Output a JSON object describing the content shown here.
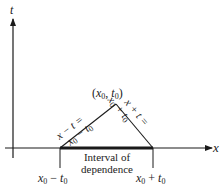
{
  "figure": {
    "axes": {
      "x_label": "x",
      "t_label": "t"
    },
    "apex": {
      "label_open": "(",
      "x_var": "x",
      "x_sub": "0",
      "sep": ", ",
      "t_var": "t",
      "t_sub": "0",
      "label_close": ")"
    },
    "left_characteristic": {
      "line1": "x − t =",
      "line2_var": "x",
      "line2_sub": "0",
      "line2_rest": " − t",
      "line2_sub2": "0"
    },
    "right_characteristic": {
      "line1": "x + t =",
      "line2_var": "x",
      "line2_sub": "0",
      "line2_rest": " + t",
      "line2_sub2": "0"
    },
    "interval": {
      "line1": "Interval of",
      "line2": "dependence"
    },
    "left_endpoint": {
      "var": "x",
      "sub": "0",
      "op": " − ",
      "t": "t",
      "tsub": "0"
    },
    "right_endpoint": {
      "var": "x",
      "sub": "0",
      "op": " + ",
      "t": "t",
      "tsub": "0"
    },
    "colors": {
      "line": "#1a1a1a",
      "background": "#ffffff"
    }
  }
}
